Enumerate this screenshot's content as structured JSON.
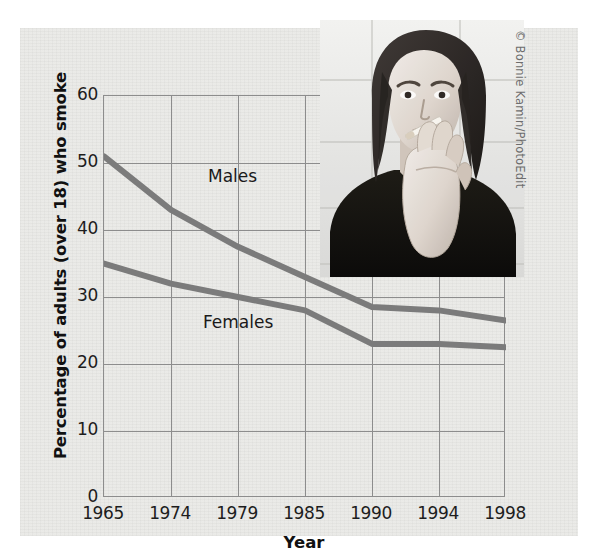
{
  "figure": {
    "photo_credit": "© Bonnie Kamin/PhotoEdit",
    "photo_alt": "Woman smoking a cigarette",
    "panel_color": "#e9e9e6",
    "line_color": "#7b7b7b",
    "grid_color": "#8d8d8d"
  },
  "chart_data": {
    "type": "line",
    "title": "",
    "xlabel": "Year",
    "ylabel": "Percentage of adults (over 18) who smoke",
    "categories": [
      "1965",
      "1974",
      "1979",
      "1985",
      "1990",
      "1994",
      "1998"
    ],
    "ylim": [
      0,
      60
    ],
    "yticks": [
      "0",
      "10",
      "20",
      "30",
      "40",
      "50",
      "60"
    ],
    "grid": true,
    "legend_position": "inline-labels",
    "series": [
      {
        "name": "Males",
        "values": [
          51,
          43,
          37.5,
          33,
          28.5,
          28,
          26.5
        ]
      },
      {
        "name": "Females",
        "values": [
          35,
          32,
          30,
          28,
          23,
          23,
          22.5
        ]
      }
    ]
  }
}
